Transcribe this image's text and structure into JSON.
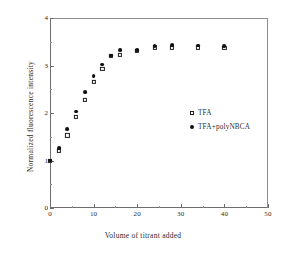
{
  "chart_data": {
    "type": "scatter",
    "title": "",
    "xlabel": "Volume of titrant added",
    "ylabel": "Normalized fluorescence intensity",
    "xlim": [
      0,
      50
    ],
    "ylim": [
      0,
      4
    ],
    "xticks": [
      0,
      10,
      20,
      30,
      40,
      50
    ],
    "xtick_labels": [
      "0",
      "10",
      "20",
      "30",
      "40",
      "50"
    ],
    "xminor_ticks": [
      5,
      15,
      25,
      35,
      45
    ],
    "yticks": [
      0,
      1,
      2,
      3,
      4
    ],
    "ytick_labels": [
      "0",
      "1",
      "2",
      "3",
      "4"
    ],
    "yminor_ticks": [
      0.5,
      1.5,
      2.5,
      3.5
    ],
    "grid": false,
    "legend_position": "center right",
    "series": [
      {
        "name": "TFA",
        "marker": "open-square",
        "color": "#1e1e1e",
        "points": [
          [
            0,
            1.0
          ],
          [
            2,
            1.21
          ],
          [
            4,
            1.53
          ],
          [
            6,
            1.92
          ],
          [
            8,
            2.28
          ],
          [
            10,
            2.66
          ],
          [
            12,
            2.93
          ],
          [
            14,
            3.2
          ],
          [
            16,
            3.23
          ],
          [
            20,
            3.31
          ],
          [
            24,
            3.38
          ],
          [
            28,
            3.37
          ],
          [
            34,
            3.38
          ],
          [
            40,
            3.37
          ]
        ]
      },
      {
        "name": "TFA+polyNBCA",
        "marker": "filled-circle",
        "color": "#111111",
        "points": [
          [
            0,
            1.0
          ],
          [
            2,
            1.26
          ],
          [
            4,
            1.66
          ],
          [
            6,
            2.03
          ],
          [
            8,
            2.44
          ],
          [
            10,
            2.78
          ],
          [
            12,
            3.02
          ],
          [
            14,
            3.21
          ],
          [
            16,
            3.32
          ],
          [
            20,
            3.33
          ],
          [
            24,
            3.41
          ],
          [
            28,
            3.43
          ],
          [
            34,
            3.42
          ],
          [
            40,
            3.41
          ]
        ]
      }
    ]
  }
}
